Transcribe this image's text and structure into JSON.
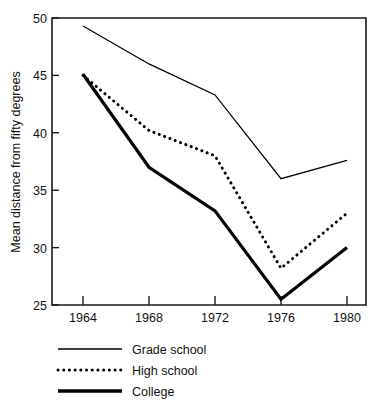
{
  "chart_data": {
    "type": "line",
    "title": "",
    "subtitle": "",
    "xlabel": "",
    "ylabel": "Mean distance from fifty degrees",
    "categories": [
      "1964",
      "1968",
      "1972",
      "1976",
      "1980"
    ],
    "x": [
      1964,
      1968,
      1972,
      1976,
      1980
    ],
    "xlim": [
      1962,
      1982
    ],
    "ylim": [
      25,
      50
    ],
    "yticks": [
      25,
      30,
      35,
      40,
      45,
      50
    ],
    "ytick_labels": [
      "25",
      "30",
      "35",
      "40",
      "45",
      "50"
    ],
    "xticks": [
      1964,
      1968,
      1972,
      1976,
      1980
    ],
    "xtick_labels": [
      "1964",
      "1968",
      "1972",
      "1976",
      "1980"
    ],
    "grid": false,
    "legend_position": "below-left",
    "series": [
      {
        "name": "Grade school",
        "style": "thin-solid",
        "values": [
          49.3,
          46.0,
          43.3,
          36.0,
          37.6
        ]
      },
      {
        "name": "High school",
        "style": "dotted",
        "values": [
          45.0,
          40.2,
          38.0,
          28.2,
          33.0
        ]
      },
      {
        "name": "College",
        "style": "thick-solid",
        "values": [
          45.1,
          37.0,
          33.2,
          25.5,
          30.0
        ]
      }
    ]
  },
  "axes": {
    "y_title": "Mean distance from fifty degrees",
    "y_tick_50": "50",
    "y_tick_45": "45",
    "y_tick_40": "40",
    "y_tick_35": "35",
    "y_tick_30": "30",
    "y_tick_25": "25",
    "x_tick_1964": "1964",
    "x_tick_1968": "1968",
    "x_tick_1972": "1972",
    "x_tick_1976": "1976",
    "x_tick_1980": "1980"
  },
  "legend": {
    "items": [
      {
        "label": "Grade school"
      },
      {
        "label": "High school"
      },
      {
        "label": "College"
      }
    ]
  },
  "colors": {
    "ink": "#000000",
    "axis": "#1a1a1a",
    "background": "#ffffff"
  }
}
